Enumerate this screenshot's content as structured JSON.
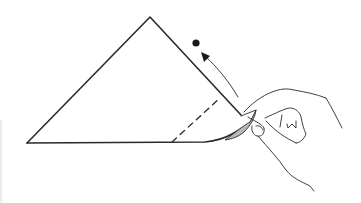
{
  "diagram": {
    "type": "origami-step",
    "colors": {
      "line": "#2a2a2a",
      "flap_fill": "#b8b8b8",
      "background": "#ffffff"
    },
    "elements": {
      "paper": "triangle",
      "fold_line": "dashed-valley-fold",
      "target": "dot",
      "motion": "curved-arrow",
      "hand": "hand-lifting-corner"
    }
  }
}
